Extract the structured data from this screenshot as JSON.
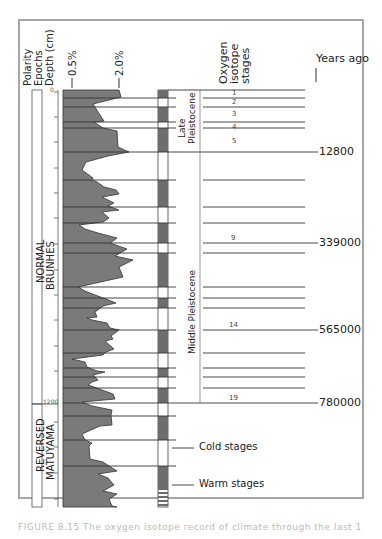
{
  "figure": {
    "column_headers": {
      "polarity": "Polarity",
      "epochs": "Epochs",
      "depth": "Depth (cm)",
      "scale_low": "0.5%",
      "scale_high": "2.0%",
      "oxygen_line1": "Oxygen",
      "oxygen_line2": "isotope",
      "oxygen_line3": "stages",
      "years_ago": "Years ago"
    },
    "polarity": {
      "normal_line1": "NORMAL",
      "normal_line2": "BRUNHES",
      "reversed_line1": "REVERSED",
      "reversed_line2": "MATUYAMA"
    },
    "depth_ticks": {
      "top": "0",
      "boundary": "1200"
    },
    "epochs": {
      "late_line1": "Late",
      "late_line2": "Pleistocene",
      "middle": "Middle Pleistocene"
    },
    "isotope_stages": [
      "1",
      "2",
      "3",
      "4",
      "5",
      "9",
      "14",
      "19"
    ],
    "years": [
      "12800",
      "339000",
      "565000",
      "780000"
    ],
    "legend": {
      "cold": "Cold stages",
      "warm": "Warm stages"
    },
    "caption": "FIGURE 8.15  The oxygen isotope record of climate through the last 1 million years"
  },
  "colors": {
    "curve_fill": "#7a7a7a",
    "stage_dark": "#6d6d6d",
    "frame": "#a6a6a6",
    "line": "#333333"
  }
}
